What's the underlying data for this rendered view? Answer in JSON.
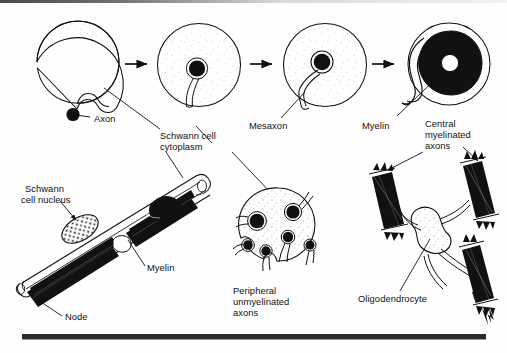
{
  "figure": {
    "background": "#fefefe",
    "ink": "#111111",
    "width": 507,
    "height": 353
  },
  "labels": {
    "axon": "Axon",
    "schwann_cell_cytoplasm_line1": "Schwann cell",
    "schwann_cell_cytoplasm_line2": "cytoplasm",
    "mesaxon": "Mesaxon",
    "myelin_top": "Myelin",
    "central_myelinated_axons_line1": "Central",
    "central_myelinated_axons_line2": "myelinated",
    "central_myelinated_axons_line3": "axons",
    "schwann_cell_nucleus_line1": "Schwann",
    "schwann_cell_nucleus_line2": "cell nucleus",
    "myelin_bottom": "Myelin",
    "node": "Node",
    "peripheral_unmyelinated_axons_line1": "Peripheral",
    "peripheral_unmyelinated_axons_line2": "unmyelinated",
    "peripheral_unmyelinated_axons_line3": "axons",
    "oligodendrocyte": "Oligodendrocyte"
  },
  "panels": {
    "stage1": {
      "name": "schwann-cell-stage-1",
      "caption": "Axon lies outside Schwann cell in a shallow groove"
    },
    "stage2": {
      "name": "schwann-cell-stage-2",
      "caption": "Axon engulfed; mesaxon formed"
    },
    "stage3": {
      "name": "schwann-cell-stage-3",
      "caption": "Mesaxon elongates"
    },
    "stage4": {
      "name": "schwann-cell-stage-4",
      "caption": "Mesaxon spirals forming compact myelin"
    },
    "longitudinal": {
      "name": "myelinated-fibre-longitudinal",
      "caption": "Longitudinal myelinated peripheral nerve fibre with node of Ranvier"
    },
    "unmyelinated": {
      "name": "unmyelinated-axons-cross-section",
      "caption": "Cross-section of Schwann cell enclosing several unmyelinated axons"
    },
    "oligodendrocyte": {
      "name": "oligodendrocyte-panel",
      "caption": "One oligodendrocyte myelinating several central axons"
    }
  },
  "arrows": {
    "count": 3,
    "direction": "right",
    "meaning": "progressive stages of myelination"
  },
  "counts": {
    "stages": 4,
    "unmyelinated_axons": 6,
    "oligodendrocyte_processes": 4
  }
}
